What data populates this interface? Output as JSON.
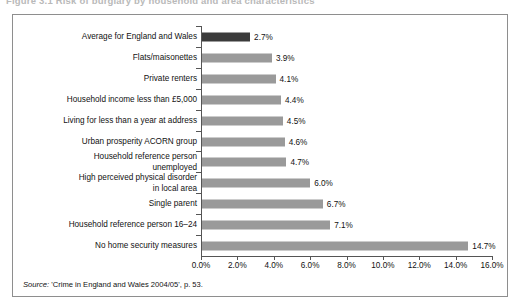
{
  "caption": {
    "text": "Figure 3.1  Risk of burglary by household and area characteristics"
  },
  "source": {
    "prefix": "Source:",
    "body": " 'Crime in England and Wales 2004/05', p. 53."
  },
  "colors": {
    "bar_default": "#9a9a9a",
    "bar_highlight": "#3b3b3b",
    "axis": "#555555",
    "frame": "#8e8e8e",
    "text": "#111111"
  },
  "chart_data": {
    "type": "bar",
    "orientation": "horizontal",
    "title": "",
    "xlabel": "",
    "ylabel": "",
    "xlim": [
      0,
      16
    ],
    "grid": false,
    "legend": null,
    "value_suffix": "%",
    "categories": [
      "Average for England and Wales",
      "Flats/maisonettes",
      "Private renters",
      "Household income less than £5,000",
      "Living for less than a year at address",
      "Urban prosperity ACORN group",
      "Household reference person\nunemployed",
      "High perceived physical disorder\nin local area",
      "Single parent",
      "Household reference person 16–24",
      "No home security measures"
    ],
    "values": [
      2.7,
      3.9,
      4.1,
      4.4,
      4.5,
      4.6,
      4.7,
      6.0,
      6.7,
      7.1,
      14.7
    ],
    "value_labels": [
      "2.7%",
      "3.9%",
      "4.1%",
      "4.4%",
      "4.5%",
      "4.6%",
      "4.7%",
      "6.0%",
      "6.7%",
      "7.1%",
      "14.7%"
    ],
    "highlight_index": 0,
    "xticks": [
      0,
      2,
      4,
      6,
      8,
      10,
      12,
      14,
      16
    ],
    "xtick_labels": [
      "0.0%",
      "2.0%",
      "4.0%",
      "6.0%",
      "8.0%",
      "10.0%",
      "12.0%",
      "14.0%",
      "16.0%"
    ]
  }
}
